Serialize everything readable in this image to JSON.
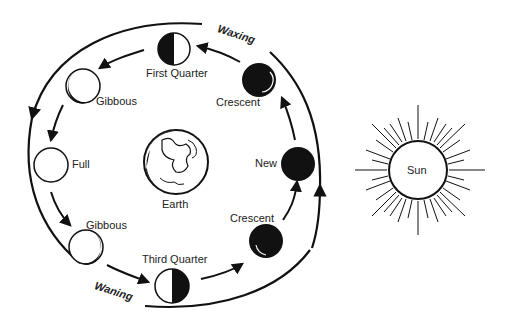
{
  "labels": {
    "waxing": "Waxing",
    "waning": "Waning",
    "earth": "Earth",
    "sun": "Sun"
  },
  "phases": [
    {
      "name": "New",
      "label": "New"
    },
    {
      "name": "waxing-crescent",
      "label": "Crescent"
    },
    {
      "name": "first-quarter",
      "label": "First Quarter"
    },
    {
      "name": "waxing-gibbous",
      "label": "Gibbous"
    },
    {
      "name": "full",
      "label": "Full"
    },
    {
      "name": "waning-gibbous",
      "label": "Gibbous"
    },
    {
      "name": "third-quarter",
      "label": "Third Quarter"
    },
    {
      "name": "waning-crescent",
      "label": "Crescent"
    }
  ],
  "colors": {
    "ink": "#111111",
    "background": "#ffffff"
  }
}
